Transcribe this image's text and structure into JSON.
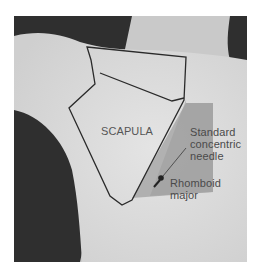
{
  "figure": {
    "labels": {
      "bone": "SCAPULA",
      "needle_line1": "Standard",
      "needle_line2": "concentric",
      "needle_line3": "needle",
      "muscle_line1": "Rhomboid",
      "muscle_line2": "major"
    },
    "colors": {
      "background_dark": "#2e2e2e",
      "skin_light": "#e2e2e2",
      "shaded_region": "#9e9e9e",
      "outline": "#2a2a2a"
    }
  }
}
